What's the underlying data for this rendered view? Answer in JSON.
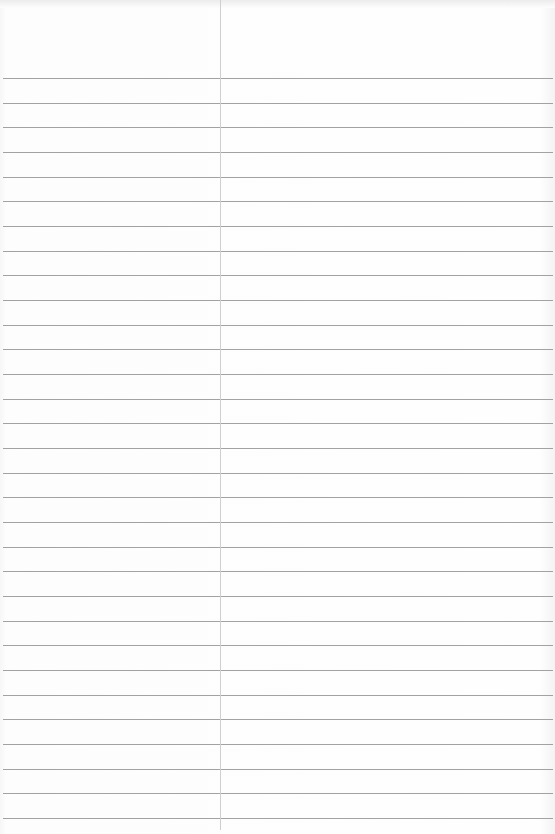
{
  "paper": {
    "type": "ruled-notepaper",
    "background": "#fdfdfd",
    "rule_color": "#a2a2a2",
    "margin_color": "#cfcfcf",
    "margin_x": 220,
    "first_rule_y": 78,
    "rule_spacing": 24.67,
    "rule_count": 31
  }
}
